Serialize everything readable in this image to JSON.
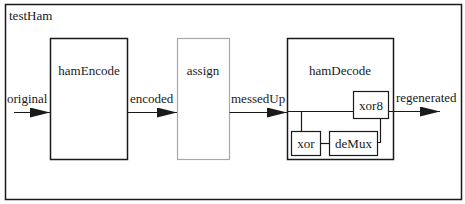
{
  "diagram": {
    "title": "testHam",
    "blocks": [
      {
        "id": "hamEncode",
        "label": "hamEncode"
      },
      {
        "id": "assign",
        "label": "assign"
      },
      {
        "id": "hamDecode",
        "label": "hamDecode",
        "children": [
          {
            "id": "xor8",
            "label": "xor8"
          },
          {
            "id": "xor",
            "label": "xor"
          },
          {
            "id": "deMux",
            "label": "deMux"
          }
        ]
      }
    ],
    "signals": [
      {
        "label": "original",
        "from": "input",
        "to": "hamEncode"
      },
      {
        "label": "encoded",
        "from": "hamEncode",
        "to": "assign"
      },
      {
        "label": "messedUp",
        "from": "assign",
        "to": "hamDecode"
      },
      {
        "label": "regenerated",
        "from": "hamDecode",
        "to": "output"
      }
    ]
  },
  "colors": {
    "stroke": "#1a1a1a",
    "assign_stroke": "#a8a8a8",
    "background": "#ffffff"
  }
}
